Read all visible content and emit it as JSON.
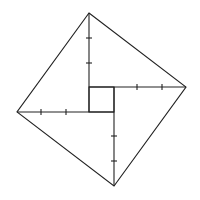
{
  "diagram": {
    "colors": {
      "background": "#ffffff",
      "stroke": "#222222"
    },
    "outer_square": {
      "top": [
        89,
        13
      ],
      "right": [
        186,
        87
      ],
      "bottom": [
        114,
        186
      ],
      "left": [
        17,
        112
      ]
    },
    "inner_square": {
      "x1": 89,
      "y1": 87,
      "x2": 114,
      "y2": 112
    },
    "legs": [
      {
        "name": "top-leg",
        "from": [
          89,
          13
        ],
        "to": [
          89,
          112
        ],
        "ticks": [
          38,
          63
        ],
        "orient": "v"
      },
      {
        "name": "right-leg",
        "from": [
          89,
          87
        ],
        "to": [
          186,
          87
        ],
        "ticks": [
          137,
          162
        ],
        "orient": "h"
      },
      {
        "name": "bottom-leg",
        "from": [
          114,
          87
        ],
        "to": [
          114,
          186
        ],
        "ticks": [
          136,
          161
        ],
        "orient": "v"
      },
      {
        "name": "left-leg",
        "from": [
          17,
          112
        ],
        "to": [
          114,
          112
        ],
        "ticks": [
          41,
          66
        ],
        "orient": "h"
      }
    ]
  }
}
